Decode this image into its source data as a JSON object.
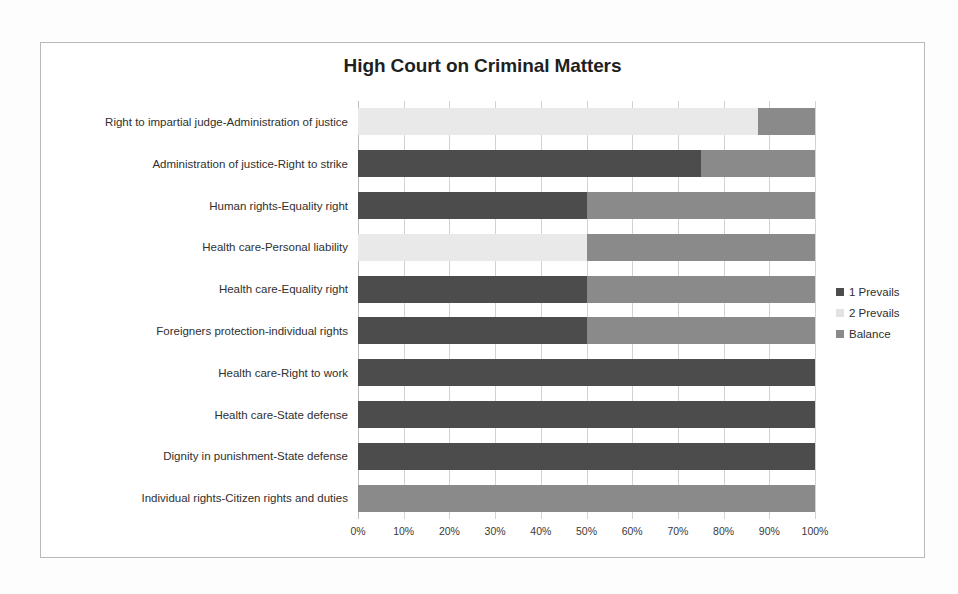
{
  "chart_data": {
    "type": "bar",
    "orientation": "horizontal",
    "stacked": true,
    "normalized": true,
    "title": "High Court on Criminal Matters",
    "xlabel": "",
    "ylabel": "",
    "xlim": [
      0,
      100
    ],
    "xtick_labels": [
      "0%",
      "10%",
      "20%",
      "30%",
      "40%",
      "50%",
      "60%",
      "70%",
      "80%",
      "90%",
      "100%"
    ],
    "xticks": [
      0,
      10,
      20,
      30,
      40,
      50,
      60,
      70,
      80,
      90,
      100
    ],
    "grid": true,
    "legend_position": "right",
    "categories": [
      "Right to impartial judge-Administration of justice",
      "Administration of justice-Right to strike",
      "Human rights-Equality right",
      "Health care-Personal liability",
      "Health care-Equality right",
      "Foreigners protection-individual rights",
      "Health care-Right to work",
      "Health care-State defense",
      "Dignity in punishment-State defense",
      "Individual rights-Citizen rights and duties"
    ],
    "series": [
      {
        "name": "1 Prevails",
        "color": "#4c4c4c",
        "values": [
          0,
          75,
          50,
          0,
          50,
          50,
          100,
          100,
          100,
          0
        ]
      },
      {
        "name": "2 Prevails",
        "color": "#e9e9e9",
        "values": [
          87.5,
          0,
          0,
          50,
          0,
          0,
          0,
          0,
          0,
          0
        ]
      },
      {
        "name": "Balance",
        "color": "#8a8a8a",
        "values": [
          12.5,
          25,
          50,
          50,
          50,
          50,
          0,
          0,
          0,
          100
        ]
      }
    ]
  },
  "legend": {
    "items": [
      {
        "label": "1 Prevails",
        "swatch": "dark"
      },
      {
        "label": "2 Prevails",
        "swatch": "light"
      },
      {
        "label": "Balance",
        "swatch": "mid"
      }
    ]
  }
}
